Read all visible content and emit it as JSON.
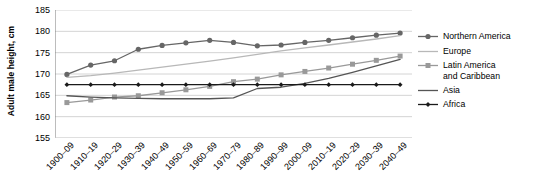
{
  "chart_data": {
    "type": "line",
    "title": "",
    "xlabel": "",
    "ylabel": "Adult male height, cm",
    "ylim": [
      155,
      185
    ],
    "yticks": [
      155,
      160,
      165,
      170,
      175,
      180,
      185
    ],
    "grid": true,
    "legend_position": "right",
    "categories": [
      "1900–09",
      "1910–19",
      "1920–29",
      "1930–39",
      "1940–49",
      "1950–59",
      "1960–69",
      "1970–79",
      "1980–89",
      "1990–99",
      "2000–09",
      "2010–19",
      "2020–29",
      "2030–39",
      "2040–49"
    ],
    "series": [
      {
        "name": "Northern America",
        "color": "#666666",
        "marker": "circle",
        "values": [
          169.9,
          172.1,
          173.1,
          175.8,
          176.7,
          177.3,
          177.9,
          177.4,
          176.6,
          176.8,
          177.4,
          177.9,
          178.5,
          179.1,
          179.6
        ]
      },
      {
        "name": "Europe",
        "color": "#b8b8b8",
        "marker": "none",
        "values": [
          169.2,
          169.6,
          170.2,
          170.9,
          171.6,
          172.3,
          173.0,
          173.8,
          174.6,
          175.4,
          176.1,
          176.8,
          177.5,
          178.2,
          179.0
        ]
      },
      {
        "name": "Latin America\nand Caribbean",
        "color": "#999999",
        "marker": "square",
        "values": [
          163.3,
          163.9,
          164.6,
          164.9,
          165.6,
          166.3,
          167.1,
          168.2,
          168.8,
          169.8,
          170.6,
          171.4,
          172.3,
          173.2,
          174.2
        ]
      },
      {
        "name": "Asia",
        "color": "#555555",
        "marker": "none",
        "values": [
          164.9,
          164.6,
          164.4,
          164.3,
          164.2,
          164.2,
          164.2,
          164.4,
          166.6,
          166.9,
          167.8,
          169.0,
          170.4,
          171.9,
          173.4
        ]
      },
      {
        "name": "Africa",
        "color": "#1a1a1a",
        "marker": "diamond",
        "values": [
          167.5,
          167.5,
          167.5,
          167.5,
          167.5,
          167.5,
          167.5,
          167.5,
          167.5,
          167.5,
          167.5,
          167.5,
          167.5,
          167.5,
          167.5
        ]
      }
    ]
  }
}
